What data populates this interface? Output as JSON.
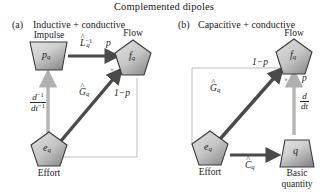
{
  "figure": {
    "title": "Complemented dipoles",
    "panels": [
      {
        "tag": "(a)",
        "subtitle": "Inductive + conductive",
        "nodes": {
          "top_left": {
            "label": "p",
            "subscript": "q",
            "caption": "Impulse",
            "shape": "trapezoid-inverted"
          },
          "top_right": {
            "label": "f",
            "subscript": "q",
            "caption": "Flow",
            "shape": "pentagon"
          },
          "bottom_left": {
            "label": "e",
            "subscript": "q",
            "caption": "Effort",
            "shape": "pentagon"
          }
        },
        "edges": {
          "horizontal_top": {
            "operator": "L",
            "hat": "^",
            "exponent": "-1",
            "subscript": "q",
            "weight": "p"
          },
          "vertical_left": {
            "numerator": "d",
            "num_exp": "-1",
            "denominator": "dt",
            "den_exp": "-1"
          },
          "diagonal": {
            "operator": "G",
            "hat": "^",
            "subscript": "q",
            "weight": "1-p"
          },
          "multiplier_mark": "×"
        }
      },
      {
        "tag": "(b)",
        "subtitle": "Capacitive + conductive",
        "nodes": {
          "top_right": {
            "label": "f",
            "subscript": "q",
            "caption": "Flow",
            "shape": "pentagon"
          },
          "bottom_left": {
            "label": "e",
            "subscript": "q",
            "caption": "Effort",
            "shape": "pentagon"
          },
          "bottom_right": {
            "label": "q",
            "subscript": "",
            "caption": "Basic quantity",
            "caption_line1": "Basic",
            "caption_line2": "quantity",
            "shape": "trapezoid"
          }
        },
        "edges": {
          "horizontal_bottom": {
            "operator": "C",
            "hat": "^",
            "subscript": "q"
          },
          "vertical_right": {
            "numerator": "d",
            "denominator": "dt",
            "weight": "p"
          },
          "diagonal": {
            "operator": "G",
            "hat": "^",
            "subscript": "q",
            "weight": "1-p"
          },
          "multiplier_mark": "×"
        }
      }
    ]
  },
  "colors": {
    "node_fill_light": "#d8d8d8",
    "node_fill_dark": "#8e8e8e",
    "node_stroke": "#3a3a3a",
    "thick_arrow": "#4a4a4a",
    "thin_arrow": "#b5b5b5",
    "thin_line": "#bdbdbd",
    "text": "#1c1c1c",
    "background": "#ffffff"
  }
}
